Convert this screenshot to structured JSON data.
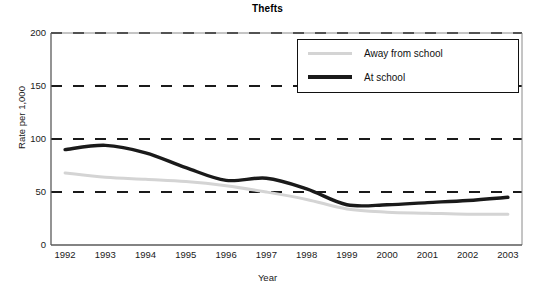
{
  "chart_data": {
    "type": "line",
    "title": "Thefts",
    "xlabel": "Year",
    "ylabel": "Rate per 1,000",
    "x": [
      1992,
      1993,
      1994,
      1995,
      1996,
      1997,
      1998,
      1999,
      2000,
      2001,
      2002,
      2003
    ],
    "categories": [
      "1992",
      "1993",
      "1994",
      "1995",
      "1996",
      "1997",
      "1998",
      "1999",
      "2000",
      "2001",
      "2002",
      "2003"
    ],
    "xlim": [
      1991.65,
      2003.35
    ],
    "ylim": [
      0,
      200
    ],
    "yticks": [
      0,
      50,
      100,
      150,
      200
    ],
    "ytick_labels": [
      "0",
      "50",
      "100",
      "150",
      "200"
    ],
    "grid": "horizontal-dashed",
    "legend_position": "top-right",
    "series": [
      {
        "name": "Away from school",
        "color": "#d4d4d4",
        "line_width": 3,
        "values": [
          68,
          64,
          62,
          60,
          56,
          50,
          43,
          34,
          31,
          30,
          29,
          29
        ]
      },
      {
        "name": "At school",
        "color": "#1a1a1a",
        "line_width": 3.4,
        "values": [
          90,
          94,
          87,
          73,
          61,
          63,
          53,
          38,
          38,
          40,
          42,
          45
        ]
      }
    ]
  },
  "chart": {
    "title": "Thefts",
    "y_axis_title": "Rate per 1,000",
    "x_axis_title": "Year"
  },
  "legend": {
    "items": [
      {
        "label": "Away from school"
      },
      {
        "label": "At school"
      }
    ]
  }
}
